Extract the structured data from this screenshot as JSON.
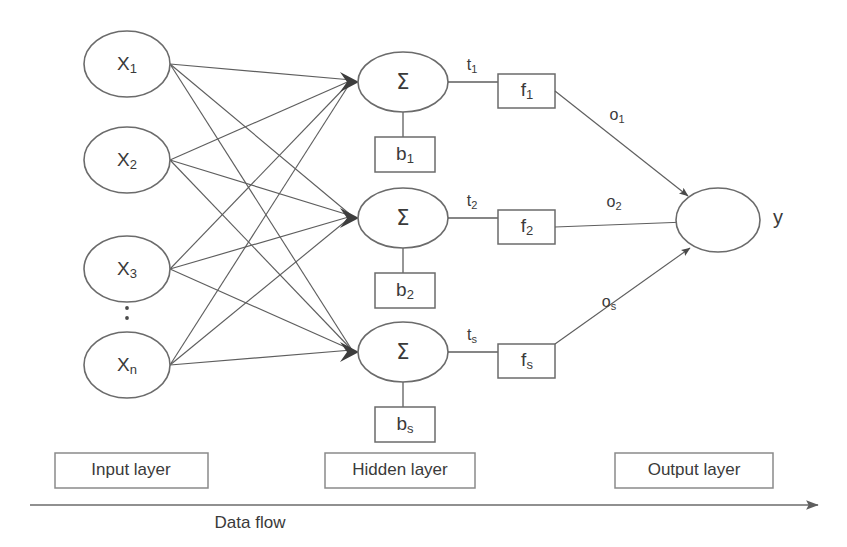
{
  "diagram": {
    "stroke_color": "#5e5e5e",
    "text_color": "#3a3a3a",
    "background": "#ffffff"
  },
  "input_layer": {
    "label": "Input layer",
    "ellipsis": ":",
    "nodes": [
      {
        "base": "X",
        "sub": "1",
        "cx": 127,
        "cy": 64,
        "rx": 43,
        "ry": 33
      },
      {
        "base": "X",
        "sub": "2",
        "cx": 127,
        "cy": 160,
        "rx": 43,
        "ry": 33
      },
      {
        "base": "X",
        "sub": "3",
        "cx": 127,
        "cy": 269,
        "rx": 43,
        "ry": 33
      },
      {
        "base": "X",
        "sub": "n",
        "cx": 127,
        "cy": 365,
        "rx": 43,
        "ry": 33
      }
    ]
  },
  "hidden_layer": {
    "label": "Hidden layer",
    "sum_symbol": "Σ",
    "nodes": [
      {
        "cx": 403,
        "cy": 82,
        "rx": 45,
        "ry": 30,
        "bias": {
          "base": "b",
          "sub": "1",
          "x": 375,
          "y": 137,
          "w": 60,
          "h": 35
        },
        "t_label": {
          "base": "t",
          "sub": "1",
          "x": 472,
          "y": 66
        },
        "activation": {
          "base": "f",
          "sub": "1",
          "x": 498,
          "y": 74,
          "w": 57,
          "h": 34
        },
        "o_label": {
          "base": "o",
          "sub": "1",
          "x": 617,
          "y": 116
        }
      },
      {
        "cx": 403,
        "cy": 218,
        "rx": 45,
        "ry": 30,
        "bias": {
          "base": "b",
          "sub": "2",
          "x": 375,
          "y": 273,
          "w": 60,
          "h": 35
        },
        "t_label": {
          "base": "t",
          "sub": "2",
          "x": 472,
          "y": 202
        },
        "activation": {
          "base": "f",
          "sub": "2",
          "x": 498,
          "y": 210,
          "w": 57,
          "h": 34
        },
        "o_label": {
          "base": "o",
          "sub": "2",
          "x": 614,
          "y": 203
        }
      },
      {
        "cx": 403,
        "cy": 352,
        "rx": 45,
        "ry": 30,
        "bias": {
          "base": "b",
          "sub": "s",
          "x": 375,
          "y": 407,
          "w": 60,
          "h": 35
        },
        "t_label": {
          "base": "t",
          "sub": "s",
          "x": 472,
          "y": 336
        },
        "activation": {
          "base": "f",
          "sub": "s",
          "x": 498,
          "y": 344,
          "w": 57,
          "h": 34
        },
        "o_label": {
          "base": "o",
          "sub": "s",
          "x": 609,
          "y": 303
        }
      }
    ]
  },
  "output_layer": {
    "label": "Output layer",
    "node": {
      "cx": 718,
      "cy": 220,
      "rx": 42,
      "ry": 32
    },
    "output_symbol": "y",
    "output_symbol_x": 778,
    "output_symbol_y": 219
  },
  "layer_labels": [
    {
      "text": "Input layer",
      "x": 55,
      "y": 453,
      "w": 153,
      "h": 35
    },
    {
      "text": "Hidden layer",
      "x": 325,
      "y": 453,
      "w": 150,
      "h": 35
    },
    {
      "text": "Output layer",
      "x": 615,
      "y": 453,
      "w": 158,
      "h": 35
    }
  ],
  "data_flow": {
    "label": "Data flow",
    "label_x": 250,
    "label_y": 524,
    "line_y": 505,
    "line_x_start": 30,
    "line_x_end": 820
  }
}
